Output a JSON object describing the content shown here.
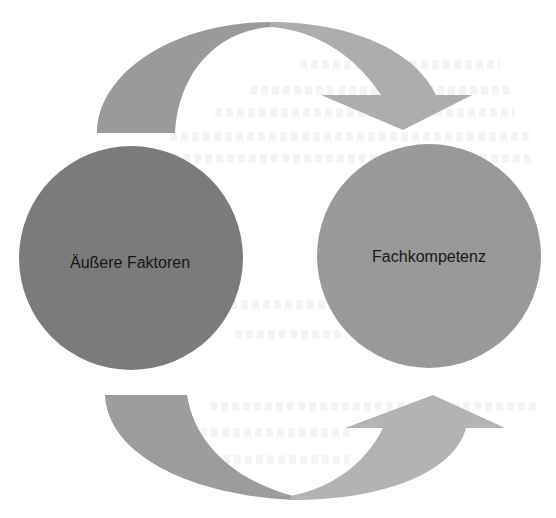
{
  "diagram": {
    "type": "cycle",
    "nodes": [
      {
        "id": "left",
        "label": "Äußere Faktoren",
        "color": "#7b7b7b"
      },
      {
        "id": "right",
        "label": "Fachkompetenz",
        "color": "#999999"
      }
    ],
    "arrows": [
      {
        "id": "top",
        "from": "left",
        "to": "right",
        "color_start": "#9a9a9a",
        "color_end": "#adadad"
      },
      {
        "id": "bottom",
        "from": "left",
        "to": "right",
        "color_start": "#9c9c9c",
        "color_end": "#b3b3b3"
      }
    ],
    "text_color": "#161616",
    "background": "#ffffff"
  }
}
